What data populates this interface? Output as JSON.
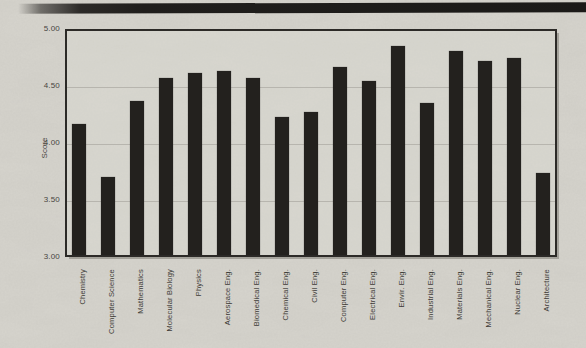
{
  "page": {
    "kind": "scanned bar chart figure",
    "paper_color": "#d7d5ce",
    "artifact_strip_color": "#1b1a18"
  },
  "chart_data": {
    "type": "bar",
    "title": "",
    "xlabel": "",
    "ylabel": "Score",
    "ylim": [
      3.0,
      5.0
    ],
    "y_ticks": [
      "5.00",
      "4.50",
      "4.00",
      "3.50",
      "3.00"
    ],
    "grid": "horizontal",
    "legend": "none",
    "bar_color": "#23211e",
    "frame_color": "#2c2a27",
    "categories": [
      "Chemistry",
      "Computer Science",
      "Mathematics",
      "Molecular Biology",
      "Physics",
      "Aerospace Eng.",
      "Biomedical Eng.",
      "Chemical Eng.",
      "Civil Eng.",
      "Computer Eng.",
      "Electrical Eng.",
      "Envir. Eng.",
      "Industrial Eng.",
      "Materials Eng.",
      "Mechanical Eng.",
      "Nuclear Eng.",
      "Architecture"
    ],
    "values": [
      4.17,
      3.7,
      4.37,
      4.57,
      4.61,
      4.63,
      4.57,
      4.23,
      4.27,
      4.67,
      4.54,
      4.85,
      4.35,
      4.81,
      4.72,
      4.75,
      3.74
    ]
  }
}
